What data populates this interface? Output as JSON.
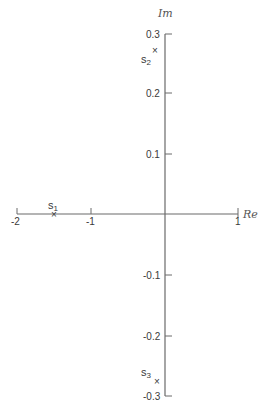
{
  "diagram": {
    "type": "complex-plane-pole-plot",
    "axes": {
      "real": {
        "label": "Re",
        "ticks": [
          {
            "value": -2,
            "label": "-2"
          },
          {
            "value": -1,
            "label": "-1"
          },
          {
            "value": 1,
            "label": "1"
          }
        ]
      },
      "imag": {
        "label": "Im",
        "ticks": [
          {
            "value": 0.3,
            "label": "0.3"
          },
          {
            "value": 0.2,
            "label": "0.2"
          },
          {
            "value": 0.1,
            "label": "0.1"
          },
          {
            "value": -0.1,
            "label": "-0.1"
          },
          {
            "value": -0.2,
            "label": "-0.2"
          },
          {
            "value": -0.3,
            "label": "-0.3"
          }
        ]
      }
    },
    "points": [
      {
        "name": "s",
        "sub": "1",
        "re": -1.5,
        "im": 0
      },
      {
        "name": "s",
        "sub": "2",
        "re": -0.05,
        "im": 0.27
      },
      {
        "name": "s",
        "sub": "3",
        "re": -0.05,
        "im": -0.27
      }
    ],
    "marker": "×"
  }
}
